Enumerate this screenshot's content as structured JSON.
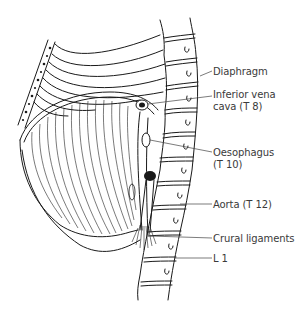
{
  "figure": {
    "type": "anatomical line drawing",
    "labels": {
      "diaphragm": "Diaphragm",
      "ivc_line1": "Inferior vena",
      "ivc_line2": "cava (T 8)",
      "oesophagus_line1": "Oesophagus",
      "oesophagus_line2": "(T 10)",
      "aorta": "Aorta (T 12)",
      "crural": "Crural ligaments",
      "l1": "L 1"
    },
    "colors": {
      "ink": "#1a1a1a",
      "label_text": "#3a3a3a",
      "background": "#ffffff"
    }
  }
}
